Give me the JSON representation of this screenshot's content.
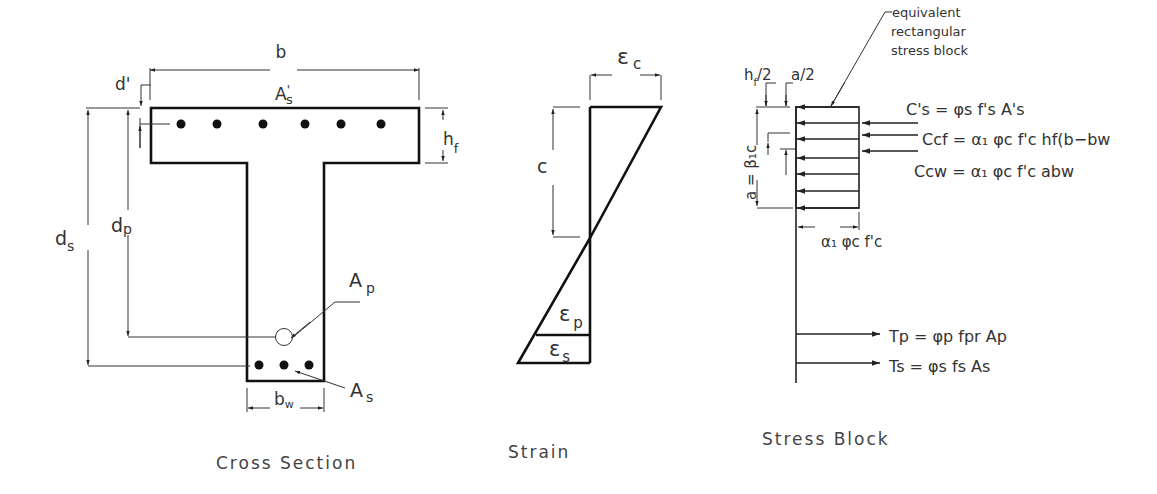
{
  "figure": {
    "panels": [
      {
        "id": "cross_section",
        "caption": "Cross Section",
        "labels": {
          "b": "b",
          "d_prime": "d'",
          "As_prime": "A",
          "As_prime_sub": "s",
          "As_prime_mark": "'",
          "hf": "h",
          "hf_sub": "f",
          "ds": "d",
          "ds_sub": "s",
          "dp": "d",
          "dp_sub": "p",
          "Ap": "A",
          "Ap_sub": "p",
          "As": "A",
          "As_sub": "s",
          "bw": "b",
          "bw_sub": "w"
        },
        "top_bars": 6,
        "bottom_bars": 3
      },
      {
        "id": "strain",
        "caption": "Strain",
        "labels": {
          "eps_c": "ε",
          "eps_c_sub": "c",
          "c": "c",
          "eps_p": "ε",
          "eps_p_sub": "p",
          "eps_s": "ε",
          "eps_s_sub": "s"
        }
      },
      {
        "id": "stress_block",
        "caption": "Stress Block",
        "callout": [
          "equivalent",
          "rectangular",
          "stress block"
        ],
        "labels": {
          "hf_half": "h",
          "hf_half_sub": "f",
          "hf_half_rest": "/2",
          "a_half": "a/2",
          "a_eq": "a = β₁c",
          "alpha_phi_fc": "α₁ φc f'c"
        },
        "equations": {
          "Cs_prime": "C's = φs f's A's",
          "Ccf": "Ccf = α₁ φc f'c hf(b−bw",
          "Ccw": "Ccw = α₁ φc f'c abw",
          "Tp": "Tp = φp fpr Ap",
          "Ts": "Ts = φs fs As"
        }
      }
    ]
  }
}
